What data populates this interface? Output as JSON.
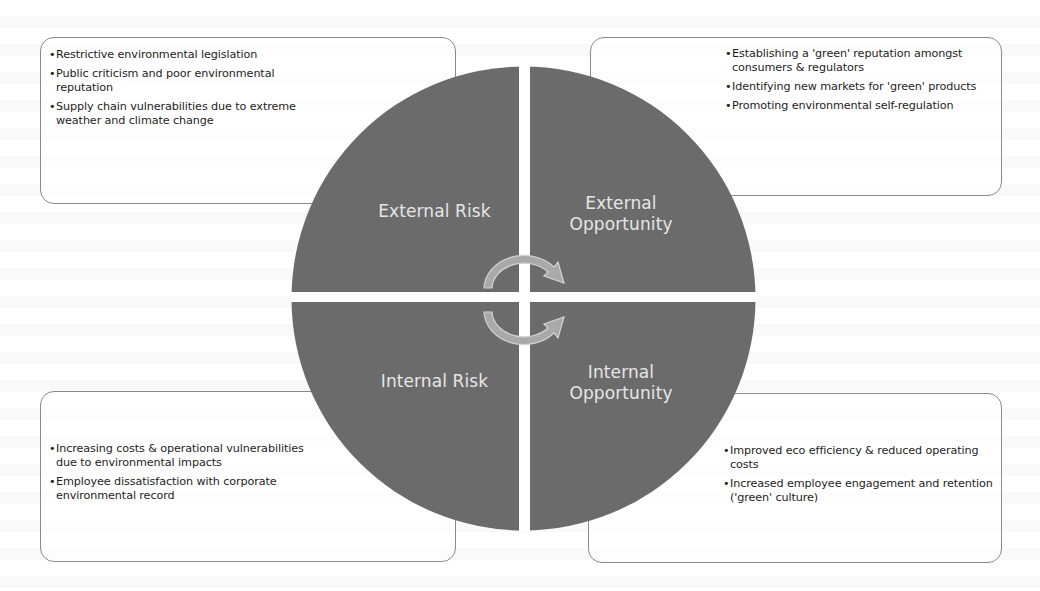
{
  "diagram": {
    "type": "quadrant-circle",
    "colors": {
      "circle_fill": "#6b6b6b",
      "divider": "#ffffff",
      "label_text": "#e6e6e6",
      "arrow_fill": "#a9a9a9",
      "arrow_outline": "#d2d2d2",
      "box_border": "#8a8a8a"
    },
    "bullet": "•",
    "quadrants": {
      "external_risk": {
        "label": "External Risk",
        "items": [
          "Restrictive environmental legislation",
          "Public criticism and poor environmental reputation",
          "Supply chain vulnerabilities due to extreme weather and climate change"
        ]
      },
      "external_opportunity": {
        "label_line1": "External",
        "label_line2": "Opportunity",
        "items": [
          "Establishing a 'green' reputation amongst consumers & regulators",
          "Identifying new markets for 'green' products",
          "Promoting environmental self-regulation"
        ]
      },
      "internal_risk": {
        "label": "Internal Risk",
        "items": [
          "Increasing costs & operational vulnerabilities due to environmental impacts",
          "Employee dissatisfaction with corporate environmental record"
        ]
      },
      "internal_opportunity": {
        "label_line1": "Internal",
        "label_line2": "Opportunity",
        "items": [
          "Improved eco efficiency & reduced operating costs",
          "Increased employee engagement and retention ('green' culture)"
        ]
      }
    },
    "center_icon": "cycle-arrows"
  }
}
